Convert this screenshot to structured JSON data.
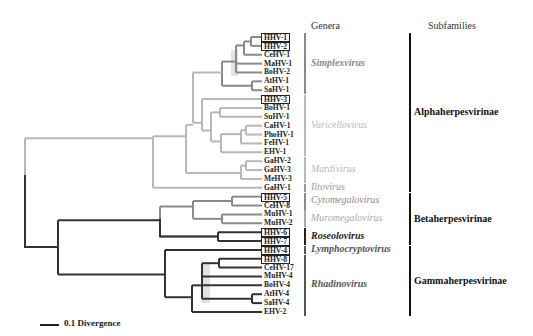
{
  "headers": {
    "genera": "Genera",
    "subfamilies": "Subfamilies"
  },
  "colors": {
    "light": "#b8b8b8",
    "mid": "#8a8a8a",
    "dark": "#333333",
    "shade": "#e2e2e2"
  },
  "leaves": [
    {
      "label": "HHV-1",
      "boxed": true
    },
    {
      "label": "HHV-2",
      "boxed": true
    },
    {
      "label": "CeHV-1",
      "boxed": false
    },
    {
      "label": "MaHV-1",
      "boxed": false
    },
    {
      "label": "BoHV-2",
      "boxed": false
    },
    {
      "label": "AtHV-1",
      "boxed": false
    },
    {
      "label": "SaHV-1",
      "boxed": false
    },
    {
      "label": "HHV-3",
      "boxed": true
    },
    {
      "label": "BoHV-1",
      "boxed": false
    },
    {
      "label": "SuHV-1",
      "boxed": false
    },
    {
      "label": "CaHV-1",
      "boxed": false
    },
    {
      "label": "PhoHV-1",
      "boxed": false
    },
    {
      "label": "FeHV-1",
      "boxed": false
    },
    {
      "label": "EHV-1",
      "boxed": false
    },
    {
      "label": "GaHV-2",
      "boxed": false
    },
    {
      "label": "GaHV-3",
      "boxed": false
    },
    {
      "label": "MeHV-3",
      "boxed": false
    },
    {
      "label": "GaHV-1",
      "boxed": false
    },
    {
      "label": "HHV-5",
      "boxed": true
    },
    {
      "label": "CeHV-8",
      "boxed": false
    },
    {
      "label": "MuHV-1",
      "boxed": false
    },
    {
      "label": "MuHV-2",
      "boxed": false
    },
    {
      "label": "HHV-6",
      "boxed": true
    },
    {
      "label": "HHV-7",
      "boxed": true
    },
    {
      "label": "HHV-4",
      "boxed": true
    },
    {
      "label": "HHV-8",
      "boxed": true
    },
    {
      "label": "CeHV-17",
      "boxed": false
    },
    {
      "label": "MuHV-4",
      "boxed": false
    },
    {
      "label": "BoHV-4",
      "boxed": false
    },
    {
      "label": "AtHV-4",
      "boxed": false
    },
    {
      "label": "SaHV-4",
      "boxed": false
    },
    {
      "label": "EHV-2",
      "boxed": false
    }
  ],
  "genera": [
    {
      "name": "Simplexvirus",
      "from": 0,
      "to": 6,
      "color": "#8a8a8a"
    },
    {
      "name": "Varicellovirus",
      "from": 7,
      "to": 13,
      "color": "#b8b8b8"
    },
    {
      "name": "Mardivirus",
      "from": 14,
      "to": 16,
      "color": "#b8b8b8"
    },
    {
      "name": "Iltovirus",
      "from": 17,
      "to": 17,
      "color": "#9a9a9a"
    },
    {
      "name": "Cytomegalovirus",
      "from": 18,
      "to": 19,
      "color": "#8a8a8a"
    },
    {
      "name": "Muromegalovirus",
      "from": 20,
      "to": 21,
      "color": "#aaaaaa"
    },
    {
      "name": "Roseolovirus",
      "from": 22,
      "to": 23,
      "color": "#222222"
    },
    {
      "name": "Lymphocryptovirus",
      "from": 24,
      "to": 24,
      "color": "#555555"
    },
    {
      "name": "Rhadinovirus",
      "from": 25,
      "to": 31,
      "color": "#555555"
    }
  ],
  "subfamilies": [
    {
      "name": "Alphaherpesvirinae",
      "from": 0,
      "to": 17
    },
    {
      "name": "Betaherpesvirinae",
      "from": 18,
      "to": 23
    },
    {
      "name": "Gammaherpesvirinae",
      "from": 24,
      "to": 31
    }
  ],
  "scale": {
    "label": "0.1 Divergence"
  }
}
